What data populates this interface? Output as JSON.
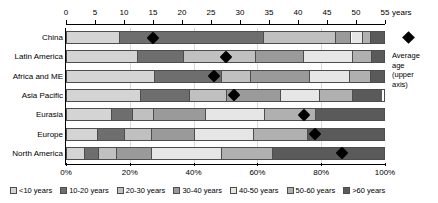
{
  "chart_data": {
    "type": "bar",
    "orientation": "horizontal",
    "stacked": "100%",
    "title": "",
    "categories": [
      "China",
      "Latin America",
      "Africa and ME",
      "Asia Pacific",
      "Eurasia",
      "Europe",
      "North America"
    ],
    "series": [
      {
        "name": "<10 years",
        "color": "#d4d4d4",
        "values": [
          17.0,
          22.5,
          28.0,
          23.5,
          14.5,
          10.0,
          6.0
        ]
      },
      {
        "name": "10-20 years",
        "color": "#6e6e6e",
        "values": [
          45.0,
          14.5,
          21.0,
          15.5,
          6.5,
          8.5,
          4.5
        ]
      },
      {
        "name": "20-30 years",
        "color": "#c0c0c0",
        "values": [
          22.5,
          22.5,
          9.0,
          11.5,
          6.5,
          8.5,
          5.5
        ]
      },
      {
        "name": "30-40 years",
        "color": "#9a9a9a",
        "values": [
          5.0,
          15.0,
          18.5,
          17.0,
          16.5,
          13.5,
          11.0
        ]
      },
      {
        "name": "40-50 years",
        "color": "#e6e6e6",
        "values": [
          3.5,
          15.5,
          12.5,
          12.0,
          18.5,
          18.5,
          22.0
        ]
      },
      {
        "name": "50-60 years",
        "color": "#b0b0b0",
        "values": [
          2.5,
          6.0,
          6.5,
          10.5,
          16.0,
          17.0,
          16.0
        ]
      },
      {
        "name": ">60 years",
        "color": "#5a5a5a",
        "values": [
          4.5,
          4.0,
          4.5,
          9.0,
          21.5,
          24.0,
          35.0
        ]
      }
    ],
    "markers": {
      "name": "Average age (upper axis)",
      "unit": "years",
      "color": "#000000",
      "axis_range": [
        0,
        55
      ],
      "values": [
        15.0,
        27.5,
        25.5,
        29.0,
        41.0,
        43.0,
        47.5
      ]
    },
    "top_axis": {
      "label": "years",
      "min": 0,
      "max": 55,
      "ticks": [
        "0",
        "5",
        "10",
        "15",
        "20",
        "25",
        "30",
        "35",
        "40",
        "45",
        "50",
        "55"
      ],
      "tick_values": [
        0,
        5,
        10,
        15,
        20,
        25,
        30,
        35,
        40,
        45,
        50,
        55
      ]
    },
    "bottom_axis": {
      "label": "",
      "min": 0,
      "max": 100,
      "ticks": [
        "0%",
        "20%",
        "40%",
        "60%",
        "80%",
        "100%"
      ],
      "tick_values": [
        0,
        20,
        40,
        60,
        80,
        100
      ]
    },
    "grid": true,
    "legend_position": "bottom"
  },
  "annotation": {
    "marker_title": "Average",
    "line1": "Average",
    "line2": "age",
    "line3": "(upper",
    "line4": "axis)"
  }
}
